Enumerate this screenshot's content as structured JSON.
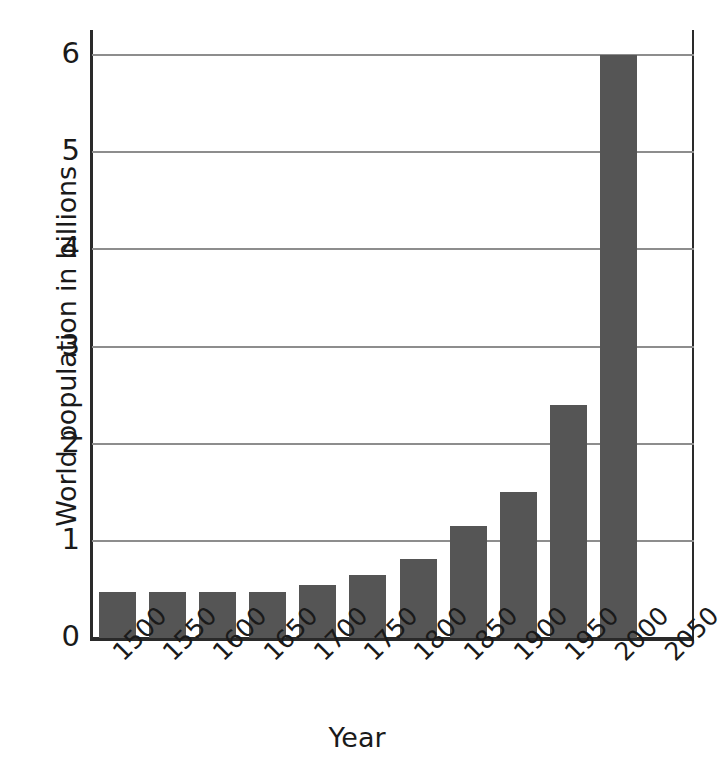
{
  "chart_data": {
    "type": "bar",
    "title": "",
    "xlabel": "Year",
    "ylabel": "World population in billions",
    "categories": [
      "1500",
      "1550",
      "1600",
      "1650",
      "1700",
      "1750",
      "1800",
      "1850",
      "1900",
      "1950",
      "2000",
      "2050"
    ],
    "values": [
      0.47,
      0.47,
      0.47,
      0.47,
      0.55,
      0.65,
      0.81,
      1.15,
      1.5,
      2.4,
      6.0,
      null
    ],
    "ylim": [
      0,
      6
    ],
    "yticks": [
      0,
      1,
      2,
      3,
      4,
      5,
      6
    ],
    "ytick_labels": [
      "0",
      "1",
      "2",
      "3",
      "4",
      "5",
      "6"
    ],
    "grid": "horizontal",
    "legend": "none",
    "bar_color": "#555555",
    "gridline_color": "#8d8d8d",
    "axis_color": "#2a2a2a",
    "background_color": "#ffffff"
  }
}
